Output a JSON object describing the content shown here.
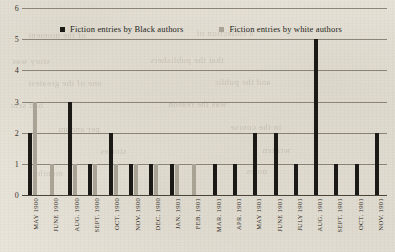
{
  "chart_data": {
    "type": "bar",
    "title": "",
    "subtitle": "",
    "xlabel": "",
    "ylabel": "",
    "ylim": [
      0,
      6
    ],
    "yticks": [
      0,
      1,
      2,
      3,
      4,
      5,
      6
    ],
    "grid": true,
    "legend_position": "top-center",
    "categories": [
      "MAY 1900",
      "JUNE 1900",
      "AUG. 1900",
      "SEPT. 1900",
      "OCT. 1900",
      "NOV. 1900",
      "DEC. 1900",
      "JAN. 1901",
      "FEB. 1901",
      "MAR. 1901",
      "APR. 1901",
      "MAY 1901",
      "JUNE 1901",
      "JULY 1901",
      "AUG. 1901",
      "SEPT. 1901",
      "OCT. 1901",
      "NOV. 1901"
    ],
    "series": [
      {
        "name": "Fiction entries by Black authors",
        "color": "#1c1a17",
        "values": [
          2,
          0,
          3,
          1,
          2,
          1,
          1,
          1,
          0,
          1,
          1,
          2,
          2,
          1,
          5,
          1,
          1,
          2
        ]
      },
      {
        "name": "Fiction entries by white authors",
        "color": "#a9a396",
        "values": [
          3,
          1,
          1,
          1,
          1,
          1,
          1,
          1,
          1,
          0,
          0,
          0,
          0,
          0,
          0,
          0,
          0,
          0
        ]
      }
    ]
  },
  "legend": {
    "items": [
      {
        "label": "Fiction entries by Black authors",
        "swatch": "black"
      },
      {
        "label": "Fiction entries by white authors",
        "swatch": "gray"
      }
    ]
  },
  "bleed_through": [
    {
      "text": "of the moment",
      "x": 28,
      "y": 30
    },
    {
      "text": "a collection of",
      "x": 196,
      "y": 28
    },
    {
      "text": "story was",
      "x": 12,
      "y": 56
    },
    {
      "text": "that the publishers",
      "x": 150,
      "y": 55
    },
    {
      "text": "one of the greatest",
      "x": 28,
      "y": 78
    },
    {
      "text": "and the public",
      "x": 214,
      "y": 77
    },
    {
      "text": "had sent",
      "x": 10,
      "y": 100
    },
    {
      "text": "was the reason",
      "x": 168,
      "y": 99
    },
    {
      "text": "per annum",
      "x": 58,
      "y": 124
    },
    {
      "text": "in the course",
      "x": 230,
      "y": 122
    },
    {
      "text": "stories",
      "x": 100,
      "y": 146
    },
    {
      "text": "written",
      "x": 262,
      "y": 145
    },
    {
      "text": "months",
      "x": 34,
      "y": 168
    },
    {
      "text": "notes",
      "x": 246,
      "y": 166
    }
  ]
}
